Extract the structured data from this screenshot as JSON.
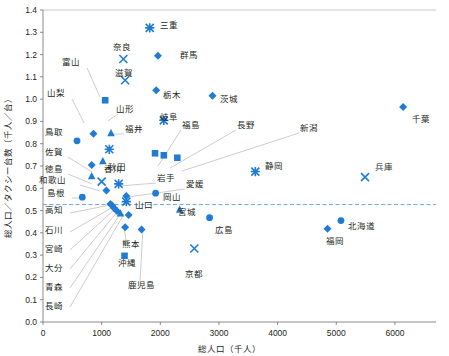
{
  "chart_data": {
    "type": "scatter",
    "title": "",
    "xlabel": "総人口（千人）",
    "ylabel": "総人口／タクシー台数（千人／台）",
    "xlim": [
      0,
      6700
    ],
    "ylim": [
      0.0,
      1.4
    ],
    "xticks": [
      0,
      1000,
      2000,
      3000,
      4000,
      5000,
      6000
    ],
    "yticks": [
      0.0,
      0.1,
      0.2,
      0.3,
      0.4,
      0.5,
      0.6,
      0.7,
      0.8,
      0.9,
      1.0,
      1.1,
      1.2,
      1.3,
      1.4
    ],
    "grid": false,
    "legend": "none",
    "accent_color": "#1f7bd4",
    "reference_line": {
      "y": 0.527,
      "style": "dashed",
      "color": "#4a90d9"
    },
    "marker_shapes": [
      "diamond",
      "triangle",
      "square",
      "circle",
      "cross",
      "asterisk"
    ],
    "points": [
      {
        "name": "三重",
        "x": 1820,
        "y": 1.32,
        "marker": "asterisk",
        "label_side": "right"
      },
      {
        "name": "群馬",
        "x": 1960,
        "y": 1.195,
        "marker": "diamond",
        "label_side": "right"
      },
      {
        "name": "奈良",
        "x": 1370,
        "y": 1.18,
        "marker": "cross",
        "label_side": "above"
      },
      {
        "name": "滋賀",
        "x": 1400,
        "y": 1.085,
        "marker": "cross",
        "label_side": "above"
      },
      {
        "name": "栃木",
        "x": 1930,
        "y": 1.04,
        "marker": "diamond",
        "label_side": "right"
      },
      {
        "name": "茨城",
        "x": 2890,
        "y": 1.015,
        "marker": "diamond",
        "label_side": "right"
      },
      {
        "name": "富山",
        "x": 1060,
        "y": 0.995,
        "marker": "square",
        "label_leader": true
      },
      {
        "name": "岐阜",
        "x": 2060,
        "y": 0.905,
        "marker": "asterisk",
        "label_side": "right"
      },
      {
        "name": "山形",
        "x": 1160,
        "y": 0.848,
        "marker": "triangle",
        "label_leader": true
      },
      {
        "name": "山梨",
        "x": 860,
        "y": 0.845,
        "marker": "diamond",
        "label_leader": true
      },
      {
        "name": "鳥取",
        "x": 580,
        "y": 0.813,
        "marker": "circle",
        "label_side": "left"
      },
      {
        "name": "福井",
        "x": 1130,
        "y": 0.775,
        "marker": "asterisk",
        "label_leader": true
      },
      {
        "name": "福島",
        "x": 1910,
        "y": 0.757,
        "marker": "square",
        "label_leader": true
      },
      {
        "name": "長野",
        "x": 2060,
        "y": 0.748,
        "marker": "square",
        "label_leader": true
      },
      {
        "name": "新潟",
        "x": 2290,
        "y": 0.737,
        "marker": "square",
        "label_leader": true
      },
      {
        "name": "千葉",
        "x": 6140,
        "y": 0.965,
        "marker": "diamond",
        "label_side": "right"
      },
      {
        "name": "秋田",
        "x": 1020,
        "y": 0.722,
        "marker": "triangle",
        "label_side": "right"
      },
      {
        "name": "佐賀",
        "x": 830,
        "y": 0.705,
        "marker": "diamond",
        "label_leader": true
      },
      {
        "name": "徳島",
        "x": 830,
        "y": 0.655,
        "marker": "triangle",
        "label_leader": true
      },
      {
        "name": "香川",
        "x": 1000,
        "y": 0.63,
        "marker": "cross",
        "label_side": "above"
      },
      {
        "name": "岩手",
        "x": 1290,
        "y": 0.62,
        "marker": "asterisk",
        "label_leader": true
      },
      {
        "name": "静岡",
        "x": 3620,
        "y": 0.675,
        "marker": "asterisk",
        "label_side": "right"
      },
      {
        "name": "兵庫",
        "x": 5490,
        "y": 0.65,
        "marker": "cross",
        "label_side": "right"
      },
      {
        "name": "和歌山",
        "x": 1080,
        "y": 0.59,
        "marker": "diamond",
        "label_leader": true
      },
      {
        "name": "島根",
        "x": 670,
        "y": 0.56,
        "marker": "circle",
        "label_leader": true
      },
      {
        "name": "愛媛",
        "x": 1420,
        "y": 0.565,
        "marker": "diamond",
        "label_leader": true
      },
      {
        "name": "岡山",
        "x": 1920,
        "y": 0.578,
        "marker": "circle",
        "label_side": "right"
      },
      {
        "name": "山口",
        "x": 1420,
        "y": 0.54,
        "marker": "asterisk",
        "label_side": "right"
      },
      {
        "name": "高知",
        "x": 1150,
        "y": 0.53,
        "marker": "diamond",
        "label_leader": true
      },
      {
        "name": "石川",
        "x": 1180,
        "y": 0.523,
        "marker": "diamond",
        "label_leader": true
      },
      {
        "name": "宮城",
        "x": 2330,
        "y": 0.505,
        "marker": "triangle",
        "label_side": "right"
      },
      {
        "name": "宮崎",
        "x": 1210,
        "y": 0.512,
        "marker": "diamond",
        "label_leader": true
      },
      {
        "name": "広島",
        "x": 2840,
        "y": 0.468,
        "marker": "circle",
        "label_side": "right"
      },
      {
        "name": "大分",
        "x": 1260,
        "y": 0.498,
        "marker": "diamond",
        "label_leader": true
      },
      {
        "name": "熊本",
        "x": 1400,
        "y": 0.425,
        "marker": "diamond",
        "label_leader": true
      },
      {
        "name": "青森",
        "x": 1320,
        "y": 0.488,
        "marker": "triangle",
        "label_leader": true
      },
      {
        "name": "長崎",
        "x": 1460,
        "y": 0.48,
        "marker": "diamond",
        "label_leader": true
      },
      {
        "name": "鹿児島",
        "x": 1680,
        "y": 0.415,
        "marker": "diamond",
        "label_leader": true
      },
      {
        "name": "沖縄",
        "x": 1390,
        "y": 0.297,
        "marker": "square",
        "label_side": "below"
      },
      {
        "name": "京都",
        "x": 2580,
        "y": 0.33,
        "marker": "cross",
        "label_side": "below"
      },
      {
        "name": "北海道",
        "x": 5080,
        "y": 0.455,
        "marker": "circle",
        "label_side": "right"
      },
      {
        "name": "福岡",
        "x": 4850,
        "y": 0.418,
        "marker": "diamond",
        "label_side": "below"
      }
    ]
  },
  "axes": {
    "x_title": "総人口（千人）",
    "y_title": "総人口／タクシー台数（千人／台）",
    "x_tick_labels": [
      "0",
      "1000",
      "2000",
      "3000",
      "4000",
      "5000",
      "6000"
    ],
    "y_tick_labels": [
      "0.0",
      "0.1",
      "0.2",
      "0.3",
      "0.4",
      "0.5",
      "0.6",
      "0.7",
      "0.8",
      "0.9",
      "1.0",
      "1.1",
      "1.2",
      "1.3",
      "1.4"
    ]
  }
}
